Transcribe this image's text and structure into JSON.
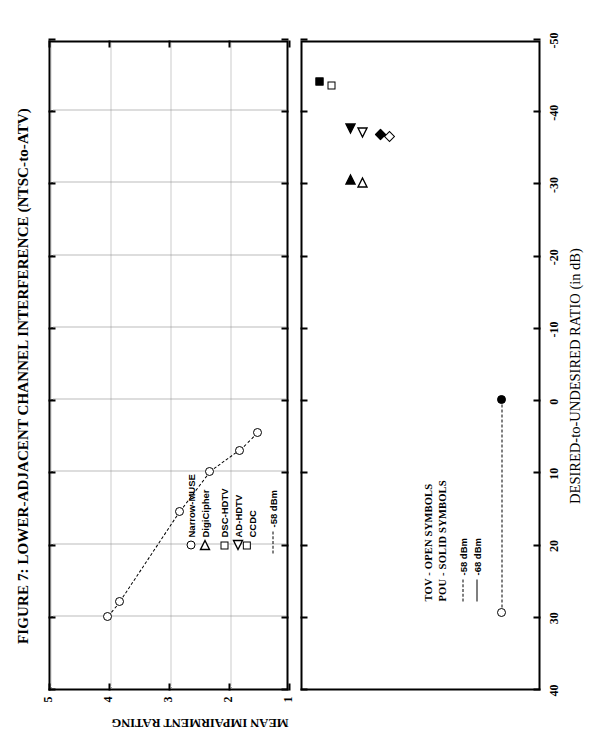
{
  "figure": {
    "title": "FIGURE 7: LOWER-ADJACENT CHANNEL INTERFERENCE (NTSC-to-ATV)",
    "xlabel": "DESIRED-to-UNDESIRED RATIO (in dB)",
    "ylabel_top": "MEAN IMPAIRMENT RATING"
  },
  "legend_top": {
    "symbol_items": [
      {
        "label": "Narrow-MUSE",
        "marker": "circle"
      },
      {
        "label": "DigiCipher",
        "marker": "triangle-right"
      },
      {
        "label": "DSC-HDTV",
        "marker": "square"
      },
      {
        "label": "AD-HDTV",
        "marker": "triangle-left"
      },
      {
        "label": "CCDC",
        "marker": "diamond"
      }
    ],
    "line_items": [
      {
        "label": "-58 dBm",
        "style": "dashed"
      }
    ]
  },
  "legend_bottom": {
    "notes": [
      "TOV - OPEN SYMBOLS",
      "POU - SOLID SYMBOLS"
    ],
    "line_items": [
      {
        "label": "-58 dBm",
        "style": "dashed"
      },
      {
        "label": "-68 dBm",
        "style": "solid"
      }
    ]
  },
  "chart_data": [
    {
      "id": "top-panel",
      "type": "line",
      "title": "FIGURE 7: LOWER-ADJACENT CHANNEL INTERFERENCE (NTSC-to-ATV)",
      "xlabel": "DESIRED-to-UNDESIRED RATIO (in dB)",
      "ylabel": "MEAN IMPAIRMENT RATING",
      "xlim": [
        40,
        -50
      ],
      "ylim": [
        1,
        5
      ],
      "xticks": [
        40,
        30,
        20,
        10,
        0,
        -10,
        -20,
        -30,
        -40,
        -50
      ],
      "yticks": [
        1,
        2,
        3,
        4,
        5
      ],
      "grid": true,
      "series": [
        {
          "name": "Narrow-MUSE",
          "marker": "circle",
          "fill": "open",
          "linestyle": "dashed",
          "points": [
            {
              "x": 30.0,
              "y": 4.05
            },
            {
              "x": 28.0,
              "y": 3.85
            },
            {
              "x": 15.5,
              "y": 2.85
            },
            {
              "x": 10.0,
              "y": 2.35
            },
            {
              "x": 7.0,
              "y": 1.85
            },
            {
              "x": 4.5,
              "y": 1.55
            }
          ]
        }
      ]
    },
    {
      "id": "bottom-panel",
      "type": "scatter",
      "xlabel": "DESIRED-to-UNDESIRED RATIO (in dB)",
      "ylabel": "",
      "xlim": [
        40,
        -50
      ],
      "ylim": [
        0,
        1
      ],
      "xticks": [
        40,
        30,
        20,
        10,
        0,
        -10,
        -20,
        -30,
        -40,
        -50
      ],
      "grid": false,
      "series": [
        {
          "name": "Narrow-MUSE TOV",
          "marker": "circle",
          "fill": "open",
          "points": [
            {
              "x": 29.5,
              "y": 0.17
            }
          ]
        },
        {
          "name": "Narrow-MUSE POU",
          "marker": "circle",
          "fill": "solid",
          "points": [
            {
              "x": 0.0,
              "y": 0.17
            }
          ]
        },
        {
          "name": "DigiCipher TOV",
          "marker": "triangle-right",
          "fill": "open",
          "points": [
            {
              "x": -30.0,
              "y": 0.75
            }
          ]
        },
        {
          "name": "DigiCipher POU",
          "marker": "triangle-right",
          "fill": "solid",
          "points": [
            {
              "x": -30.5,
              "y": 0.8
            }
          ]
        },
        {
          "name": "DSC-HDTV TOV",
          "marker": "square",
          "fill": "open",
          "points": [
            {
              "x": -43.5,
              "y": 0.88
            }
          ]
        },
        {
          "name": "DSC-HDTV POU",
          "marker": "square",
          "fill": "solid",
          "points": [
            {
              "x": -44.0,
              "y": 0.93
            }
          ]
        },
        {
          "name": "AD-HDTV TOV",
          "marker": "triangle-left",
          "fill": "open",
          "points": [
            {
              "x": -37.0,
              "y": 0.75
            }
          ]
        },
        {
          "name": "AD-HDTV POU",
          "marker": "triangle-left",
          "fill": "solid",
          "points": [
            {
              "x": -37.5,
              "y": 0.8
            }
          ]
        },
        {
          "name": "CCDC TOV",
          "marker": "diamond",
          "fill": "open",
          "points": [
            {
              "x": -37.0,
              "y": 0.62
            }
          ]
        },
        {
          "name": "CCDC POU",
          "marker": "diamond",
          "fill": "solid",
          "points": [
            {
              "x": -37.2,
              "y": 0.66
            }
          ]
        }
      ],
      "connectors": [
        {
          "from": {
            "x": 29.5,
            "y": 0.17
          },
          "to": {
            "x": 0.0,
            "y": 0.17
          },
          "style": "dashed"
        }
      ]
    }
  ]
}
